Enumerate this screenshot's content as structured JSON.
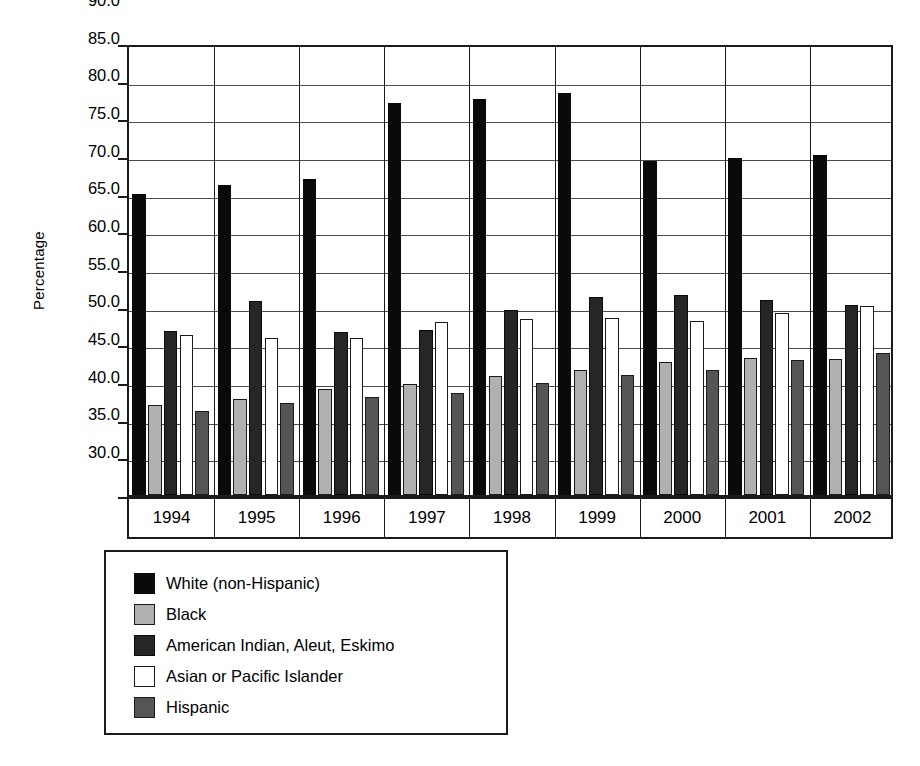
{
  "chart_data": {
    "type": "bar",
    "title": "",
    "xlabel": "",
    "ylabel": "Percentage",
    "ylim": [
      30.0,
      90.0
    ],
    "ytick_step": 5.0,
    "grid": true,
    "legend_position": "below-plot-left",
    "categories": [
      "1994",
      "1995",
      "1996",
      "1997",
      "1998",
      "1999",
      "2000",
      "2001",
      "2002"
    ],
    "ytick_labels": [
      "90.0",
      "85.0",
      "80.0",
      "75.0",
      "70.0",
      "65.0",
      "60.0",
      "55.0",
      "50.0",
      "45.0",
      "40.0",
      "35.0",
      "30.0"
    ],
    "series": [
      {
        "name": "White (non-Hispanic)",
        "key": "white_non_hispanic",
        "color": "#0a0a0a",
        "swatch": "solid-black",
        "values": [
          70.0,
          71.1,
          71.9,
          82.1,
          82.6,
          83.3,
          74.3,
          74.7,
          75.2
        ]
      },
      {
        "name": "Black",
        "key": "black",
        "color": "#b0b0b0",
        "swatch": "light-gray",
        "values": [
          42.0,
          42.7,
          44.1,
          44.7,
          45.8,
          46.6,
          47.6,
          48.2,
          48.0
        ]
      },
      {
        "name": "American Indian, Aleut, Eskimo",
        "key": "american_indian_aleut_eskimo",
        "color": "#262626",
        "swatch": "very-dark-gray",
        "values": [
          51.8,
          55.8,
          51.6,
          51.9,
          54.6,
          56.3,
          56.5,
          55.9,
          55.2
        ]
      },
      {
        "name": "Asian or Pacific Islander",
        "key": "asian_or_pacific_islander",
        "color": "#ffffff",
        "swatch": "white",
        "values": [
          51.3,
          50.8,
          50.8,
          53.0,
          53.3,
          53.5,
          53.1,
          54.2,
          55.1
        ]
      },
      {
        "name": "Hispanic",
        "key": "hispanic",
        "color": "#555555",
        "swatch": "dark-gray",
        "values": [
          41.2,
          42.2,
          43.0,
          43.5,
          44.9,
          45.9,
          46.6,
          47.9,
          48.8
        ]
      }
    ]
  },
  "axis": {
    "y_title": "Percentage"
  }
}
